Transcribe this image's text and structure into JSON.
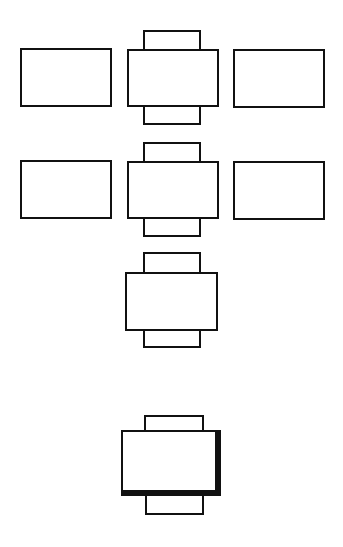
{
  "diagram": {
    "stroke_color": "#111111",
    "fill_color": "#ffffff",
    "background": "#ffffff",
    "rows": [
      {
        "id": "row-1",
        "shapes": [
          {
            "type": "plain-rect",
            "x": 20,
            "y": 48,
            "w": 92,
            "h": 59
          },
          {
            "type": "component",
            "tab_top": {
              "x": 143,
              "y": 30,
              "w": 58,
              "h": 21
            },
            "body": {
              "x": 127,
              "y": 49,
              "w": 92,
              "h": 58
            },
            "tab_bottom": {
              "x": 143,
              "y": 105,
              "w": 58,
              "h": 20
            }
          },
          {
            "type": "plain-rect",
            "x": 233,
            "y": 49,
            "w": 92,
            "h": 59
          }
        ]
      },
      {
        "id": "row-2",
        "shapes": [
          {
            "type": "plain-rect",
            "x": 20,
            "y": 160,
            "w": 92,
            "h": 59
          },
          {
            "type": "component",
            "tab_top": {
              "x": 143,
              "y": 142,
              "w": 58,
              "h": 21
            },
            "body": {
              "x": 127,
              "y": 161,
              "w": 92,
              "h": 58
            },
            "tab_bottom": {
              "x": 143,
              "y": 217,
              "w": 58,
              "h": 20
            }
          },
          {
            "type": "plain-rect",
            "x": 233,
            "y": 161,
            "w": 92,
            "h": 59
          }
        ]
      },
      {
        "id": "row-3",
        "shapes": [
          {
            "type": "component",
            "tab_top": {
              "x": 143,
              "y": 252,
              "w": 58,
              "h": 22
            },
            "body": {
              "x": 125,
              "y": 272,
              "w": 93,
              "h": 59
            },
            "tab_bottom": {
              "x": 143,
              "y": 329,
              "w": 58,
              "h": 19
            }
          }
        ]
      },
      {
        "id": "row-4",
        "shapes": [
          {
            "type": "component-shadowed",
            "tab_top": {
              "x": 144,
              "y": 415,
              "w": 60,
              "h": 17
            },
            "body": {
              "x": 121,
              "y": 430,
              "w": 100,
              "h": 66
            },
            "tab_bottom": {
              "x": 145,
              "y": 494,
              "w": 59,
              "h": 21
            }
          }
        ]
      }
    ]
  }
}
